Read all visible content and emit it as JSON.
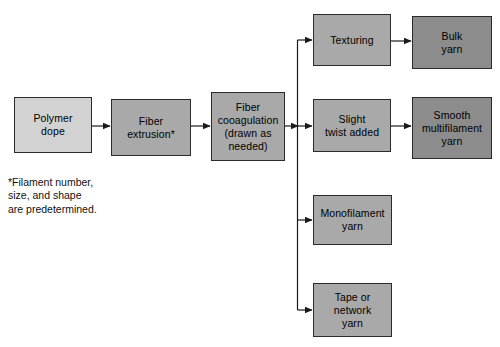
{
  "diagram": {
    "background_color": "#ffffff",
    "line_color": "#1a1a1a",
    "border_color": "#2b2b2b",
    "text_color": "#000000",
    "fills": {
      "light": "#d2d2d2",
      "medium": "#a9a9a9",
      "dark": "#8c8c8c"
    },
    "nodes": [
      {
        "id": "polymer-dope",
        "label": "Polymer\ndope",
        "x": 14,
        "y": 97,
        "w": 78,
        "h": 56,
        "fill": "#d2d2d2"
      },
      {
        "id": "fiber-extrusion",
        "label": "Fiber\nextrusion*",
        "x": 111,
        "y": 99,
        "w": 80,
        "h": 57,
        "fill": "#a9a9a9"
      },
      {
        "id": "fiber-cooagulation",
        "label": "Fiber\ncooagulation\n(drawn as\nneeded)",
        "x": 211,
        "y": 92,
        "w": 74,
        "h": 69,
        "fill": "#a9a9a9"
      },
      {
        "id": "texturing",
        "label": "Texturing",
        "x": 313,
        "y": 14,
        "w": 78,
        "h": 52,
        "fill": "#a9a9a9"
      },
      {
        "id": "bulk-yarn",
        "label": "Bulk\nyarn",
        "x": 412,
        "y": 16,
        "w": 80,
        "h": 53,
        "fill": "#8c8c8c"
      },
      {
        "id": "slight-twist-added",
        "label": "Slight\ntwist added",
        "x": 313,
        "y": 99,
        "w": 78,
        "h": 53,
        "fill": "#a9a9a9"
      },
      {
        "id": "smooth-multifilament-yarn",
        "label": "Smooth\nmultifilament\nyarn",
        "x": 412,
        "y": 97,
        "w": 80,
        "h": 62,
        "fill": "#8c8c8c"
      },
      {
        "id": "monofilament-yarn",
        "label": "Monofilament\nyarn",
        "x": 313,
        "y": 195,
        "w": 79,
        "h": 50,
        "fill": "#a9a9a9"
      },
      {
        "id": "tape-or-network-yarn",
        "label": "Tape or\nnetwork\nyarn",
        "x": 313,
        "y": 283,
        "w": 79,
        "h": 54,
        "fill": "#a9a9a9"
      }
    ],
    "footnote": "*Filament number,\n size, and shape\n are predetermined.",
    "footnote_x": 8,
    "footnote_y": 176
  }
}
